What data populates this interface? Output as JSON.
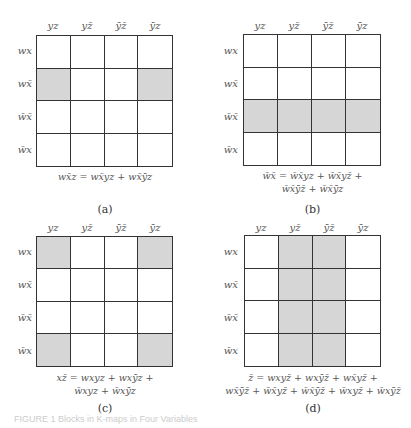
{
  "column_headers": [
    "yz",
    "yz̄",
    "ȳz̄",
    "ȳz"
  ],
  "row_headers": [
    "wx",
    "wx̄",
    "w̄x̄",
    "w̄x"
  ],
  "panels": [
    {
      "label": "(a)",
      "shaded": [
        [
          0,
          0,
          0,
          0
        ],
        [
          1,
          0,
          0,
          1
        ],
        [
          0,
          0,
          0,
          0
        ],
        [
          0,
          0,
          0,
          0
        ]
      ],
      "equation_lines": [
        "wx̄z = wx̄yz + wx̄ȳz"
      ]
    },
    {
      "label": "(b)",
      "shaded": [
        [
          0,
          0,
          0,
          0
        ],
        [
          0,
          0,
          0,
          0
        ],
        [
          1,
          1,
          1,
          1
        ],
        [
          0,
          0,
          0,
          0
        ]
      ],
      "equation_lines": [
        "w̄x̄ = w̄x̄yz + w̄x̄yz̄ +",
        "w̄x̄ȳz̄ + w̄x̄ȳz"
      ]
    },
    {
      "label": "(c)",
      "shaded": [
        [
          1,
          0,
          0,
          1
        ],
        [
          0,
          0,
          0,
          0
        ],
        [
          0,
          0,
          0,
          0
        ],
        [
          1,
          0,
          0,
          1
        ]
      ],
      "equation_lines": [
        "xz̄ = wxyz + wxȳz +",
        "w̄xyz + w̄xȳz"
      ]
    },
    {
      "label": "(d)",
      "shaded": [
        [
          0,
          1,
          1,
          0
        ],
        [
          0,
          1,
          1,
          0
        ],
        [
          0,
          1,
          1,
          0
        ],
        [
          0,
          1,
          1,
          0
        ]
      ],
      "equation_lines": [
        "z̄ = wxyz̄ + wxȳz̄ + wx̄yz̄ +",
        "wx̄ȳz̄ + w̄x̄yz̄ + w̄x̄ȳz̄ + w̄xyz̄ + w̄xȳz̄"
      ]
    }
  ],
  "colors": {
    "shade": "#d6d6d6",
    "grid": "#333333"
  },
  "figure_caption": "FIGURE 1   Blocks in K-maps in Four Variables"
}
